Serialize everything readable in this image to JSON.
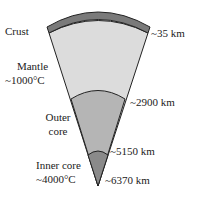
{
  "layers": [
    {
      "name": "Crust",
      "depth_label": "~35 km",
      "color": "#7a7a7a"
    },
    {
      "name": "Mantle",
      "temp_label": "~1000°C",
      "depth_label": "~2900 km",
      "color": "#dcdcdc"
    },
    {
      "name": "Outer core",
      "name_line1": "Outer",
      "name_line2": "core",
      "depth_label": "~5150 km",
      "color": "#b5b5b5"
    },
    {
      "name": "Inner core",
      "temp_label": "~4000°C",
      "depth_label": "~6370 km",
      "color": "#8a8a8a"
    }
  ]
}
